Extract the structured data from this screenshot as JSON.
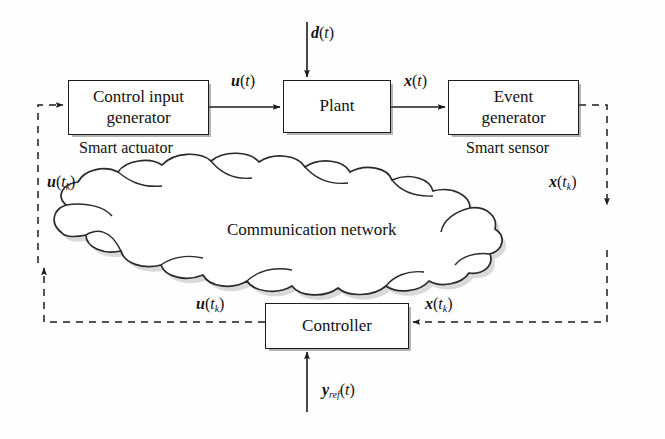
{
  "diagram": {
    "background_color": "#fefefe",
    "stroke_color": "#1b1b1b",
    "blocks": [
      {
        "id": "control_input_generator",
        "label": "Control input\ngenerator",
        "caption": "Smart actuator"
      },
      {
        "id": "plant",
        "label": "Plant",
        "caption": ""
      },
      {
        "id": "event_generator",
        "label": "Event\ngenerator",
        "caption": "Smart sensor"
      },
      {
        "id": "controller",
        "label": "Controller",
        "caption": ""
      }
    ],
    "cloud": {
      "label": "Communication network"
    },
    "captions": {
      "smart_actuator": "Smart actuator",
      "smart_sensor": "Smart sensor"
    },
    "signals": {
      "u_t": {
        "var": "u",
        "arg": "(t)",
        "sub": ""
      },
      "x_t": {
        "var": "x",
        "arg": "(t)",
        "sub": ""
      },
      "d_t": {
        "var": "d",
        "arg": "(t)",
        "sub": ""
      },
      "u_tk_top": {
        "var": "u",
        "arg": "(t",
        "sub": "k",
        "argclose": ")"
      },
      "x_tk_top": {
        "var": "x",
        "arg": "(t",
        "sub": "k",
        "argclose": ")"
      },
      "u_tk_bot": {
        "var": "u",
        "arg": "(t",
        "sub": "k",
        "argclose": ")"
      },
      "x_tk_bot": {
        "var": "x",
        "arg": "(t",
        "sub": "k",
        "argclose": ")"
      },
      "y_ref_t": {
        "var": "y",
        "sub": "ref",
        "arg": "(t)"
      }
    }
  }
}
